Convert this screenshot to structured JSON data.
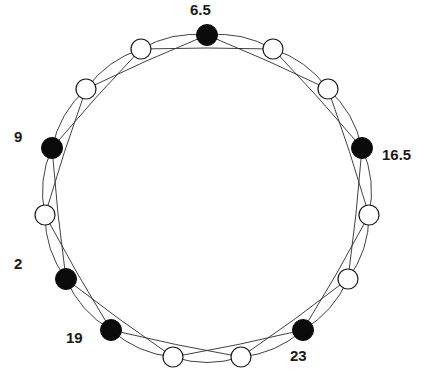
{
  "figure": {
    "kind": "circulant-graph-diagram",
    "background_color": "#ffffff",
    "width": 430,
    "height": 384,
    "node_fill_black": "#0b0b0b",
    "node_fill_white": "#ffffff",
    "node_stroke": "#1a1a1a",
    "edge_color": "#2b2b2b",
    "label_color": "#1a1a1a"
  },
  "chart_data": {
    "type": "scatter",
    "title": "",
    "xlabel": "",
    "ylabel": "",
    "grid": false,
    "legend": "none",
    "layout": "circular",
    "center": [
      207,
      198
    ],
    "radius": 163,
    "node_count": 15,
    "black_node_count": 6,
    "white_node_count": 9,
    "chord_step": 2,
    "ring_step": 1,
    "nodes": [
      {
        "index": 0,
        "angle_deg": 90,
        "x": 207,
        "y": 35,
        "color": "black",
        "label": "6.5",
        "label_x": 190,
        "label_y": 2
      },
      {
        "index": 1,
        "angle_deg": 66,
        "x": 273,
        "y": 49,
        "color": "white",
        "label": "",
        "label_x": null,
        "label_y": null
      },
      {
        "index": 2,
        "angle_deg": 42,
        "x": 328,
        "y": 89,
        "color": "white",
        "label": "",
        "label_x": null,
        "label_y": null
      },
      {
        "index": 3,
        "angle_deg": 18,
        "x": 362,
        "y": 148,
        "color": "black",
        "label": "16.5",
        "label_x": 382,
        "label_y": 147
      },
      {
        "index": 4,
        "angle_deg": -6,
        "x": 369,
        "y": 215,
        "color": "white",
        "label": "",
        "label_x": null,
        "label_y": null
      },
      {
        "index": 5,
        "angle_deg": -30,
        "x": 348,
        "y": 279,
        "color": "white",
        "label": "",
        "label_x": null,
        "label_y": null
      },
      {
        "index": 6,
        "angle_deg": -54,
        "x": 303,
        "y": 330,
        "color": "black",
        "label": "23",
        "label_x": 290,
        "label_y": 348
      },
      {
        "index": 7,
        "angle_deg": -78,
        "x": 241,
        "y": 357,
        "color": "white",
        "label": "",
        "label_x": null,
        "label_y": null
      },
      {
        "index": 8,
        "angle_deg": -102,
        "x": 173,
        "y": 357,
        "color": "white",
        "label": "",
        "label_x": null,
        "label_y": null
      },
      {
        "index": 9,
        "angle_deg": -126,
        "x": 111,
        "y": 330,
        "color": "black",
        "label": "19",
        "label_x": 66,
        "label_y": 330
      },
      {
        "index": 10,
        "angle_deg": -150,
        "x": 66,
        "y": 279,
        "color": "black",
        "label": "2",
        "label_x": 14,
        "label_y": 256
      },
      {
        "index": 11,
        "angle_deg": -174,
        "x": 45,
        "y": 215,
        "color": "white",
        "label": "",
        "label_x": null,
        "label_y": null
      },
      {
        "index": 12,
        "angle_deg": 162,
        "x": 52,
        "y": 148,
        "color": "black",
        "label": "9",
        "label_x": 14,
        "label_y": 129
      },
      {
        "index": 13,
        "angle_deg": 138,
        "x": 86,
        "y": 89,
        "color": "white",
        "label": "",
        "label_x": null,
        "label_y": null
      },
      {
        "index": 14,
        "angle_deg": 114,
        "x": 141,
        "y": 49,
        "color": "white",
        "label": "",
        "label_x": null,
        "label_y": null
      }
    ],
    "labels": [
      "6.5",
      "16.5",
      "23",
      "19",
      "2",
      "9"
    ],
    "values": [
      6.5,
      16.5,
      23,
      19,
      2,
      9
    ],
    "categories": [
      "6.5",
      "16.5",
      "23",
      "19",
      "2",
      "9"
    ]
  }
}
